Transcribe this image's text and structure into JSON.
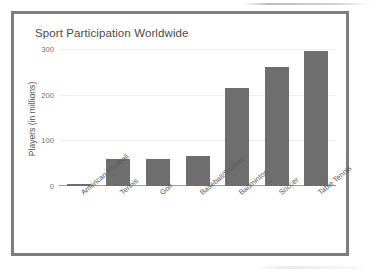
{
  "chart_data": {
    "type": "bar",
    "title": "Sport Participation Worldwide",
    "xlabel": "",
    "ylabel": "Players (in millions)",
    "categories": [
      "American Football",
      "Tennis",
      "Golf",
      "Baseball/Softball",
      "Badminton",
      "Soccer",
      "Table Tennis"
    ],
    "values": [
      5,
      60,
      60,
      65,
      215,
      260,
      295
    ],
    "ylim": [
      0,
      300
    ],
    "yticks": [
      0,
      100,
      200,
      300
    ],
    "ytick_labels": [
      "0",
      "100",
      "200",
      "300"
    ],
    "grid": true,
    "legend": false,
    "bar_color": "#6e6e6e",
    "gridline_color": "#ededed",
    "axis_color": "#9c9c9c",
    "frame_color": "#7d7d7d",
    "title_color": "#4a4a4a",
    "tick_label_color": "#6e6e6e"
  }
}
